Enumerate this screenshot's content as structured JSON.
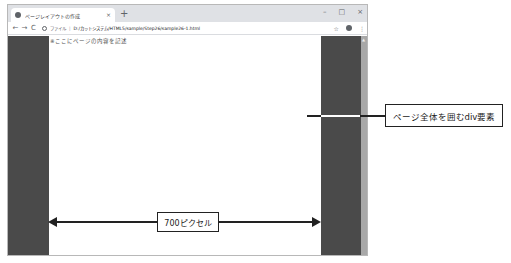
{
  "browser": {
    "tab": {
      "title": "ページレイアウトの作成",
      "favicon": "globe-icon",
      "close_glyph": "×"
    },
    "new_tab_glyph": "+",
    "window_controls": {
      "minimize": "–",
      "maximize": "□",
      "close": "×"
    },
    "toolbar": {
      "back": "←",
      "forward": "→",
      "reload": "C",
      "protocol_label": "ファイル",
      "separator": "|",
      "url": "D:/カットシステム/HTML5/sample/Step26/sample26-1.html",
      "star": "☆",
      "menu": "⋮"
    },
    "page": {
      "content_text": "※ここにページの内容を記述",
      "side_color": "#4a4a4a"
    },
    "scrollbar": {
      "up_arrow": "▲"
    }
  },
  "annotations": {
    "div_callout": "ページ全体を囲むdiv要素",
    "width_label": "700ピクセル"
  }
}
